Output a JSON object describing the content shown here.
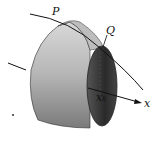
{
  "labels": {
    "P": "P",
    "Q": "Q",
    "xk": "x",
    "xk_sub": "k",
    "x_axis": "x"
  },
  "colors": {
    "surface_light": "#cfcfcf",
    "surface_dark": "#6a6a6a",
    "inner_dark": "#2a2a2a",
    "line": "#111111"
  }
}
